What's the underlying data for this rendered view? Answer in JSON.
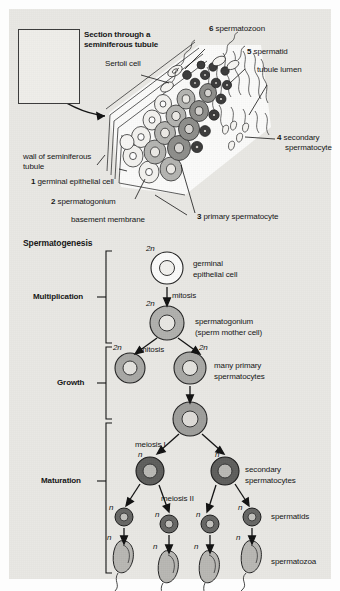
{
  "figure": {
    "top_panel": {
      "title": "Section through a\nseminiferous tubule",
      "labels": {
        "sertoli": "Sertoli cell",
        "wall": "wall of seminiferous\ntubule",
        "basement": "basement membrane",
        "lumen": "tubule lumen"
      },
      "numbered": [
        {
          "n": "1",
          "text": " germinal epithelial cell"
        },
        {
          "n": "2",
          "text": " spermatogonium"
        },
        {
          "n": "3",
          "text": " primary spermatocyte"
        },
        {
          "n": "4",
          "text": " secondary"
        },
        {
          "n": "4b",
          "text": "spermatocyte"
        },
        {
          "n": "5",
          "text": " spermatid"
        },
        {
          "n": "6",
          "text": " spermatozoon"
        }
      ]
    },
    "flow_panel": {
      "heading": "Spermatogenesis",
      "stages": [
        {
          "label": "Multiplication"
        },
        {
          "label": "Growth"
        },
        {
          "label": "Maturation"
        }
      ],
      "cell_labels": [
        {
          "text": "germinal"
        },
        {
          "text": "epithelial cell"
        },
        {
          "text": "spermatogonium"
        },
        {
          "text": "(sperm mother cell)"
        },
        {
          "text": "many primary"
        },
        {
          "text": "spermatocytes"
        },
        {
          "text": "secondary"
        },
        {
          "text": "spermatocytes"
        },
        {
          "text": "spermatids"
        },
        {
          "text": "spermatozoa"
        }
      ],
      "processes": [
        {
          "text": "mitosis"
        },
        {
          "text": "mitosis"
        },
        {
          "text": "meiosis I"
        },
        {
          "text": "meiosis II"
        }
      ],
      "ploidy": {
        "diploid": "2n",
        "haploid": "n"
      },
      "ploidy_marks": [
        "2n",
        "2n",
        "2n",
        "2n",
        "n",
        "n",
        "n",
        "n",
        "n",
        "n",
        "n",
        "n",
        "n",
        "n"
      ]
    }
  },
  "colors": {
    "background": "#e9e8e4",
    "ink": "#141414",
    "cell_mid": "#a9a9a9",
    "cell_dark": "#6f6f6f",
    "cell_light": "#d8d8d4",
    "nucleus": "#c9c9c6"
  }
}
